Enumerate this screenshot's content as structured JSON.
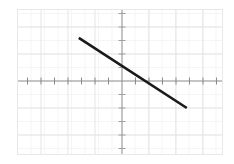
{
  "chart_data": {
    "type": "line",
    "title": "",
    "subtitle": "",
    "xlabel": "",
    "ylabel": "",
    "grid": true,
    "legend": null,
    "legend_position": "none",
    "xlim": [
      -7.7,
      7.4
    ],
    "ylim": [
      -6.1,
      5.3
    ],
    "x_tick_step": 1,
    "y_tick_step": 1,
    "x_tick_labels": [],
    "y_tick_labels": [],
    "series": [
      {
        "name": "line",
        "color": "#1a1a1a",
        "x": [
          -3.2,
          4.8
        ],
        "y": [
          3.2,
          -2.0
        ],
        "slope": -0.65,
        "y_intercept": 1.12,
        "x_intercept": 1.72,
        "endpoints": [
          {
            "x": -3.2,
            "y": 3.2
          },
          {
            "x": 4.8,
            "y": -2.0
          }
        ]
      }
    ],
    "annotations": []
  },
  "axes": {
    "x_axis_label": "x-axis",
    "y_axis_label": "y-axis",
    "origin_label": "origin"
  },
  "colors": {
    "line": "#1a1a1a",
    "axis": "#8a8a8a",
    "grid_major": "#e2e2e2",
    "grid_minor": "#f0f0f0",
    "frame": "#e8e8e8",
    "background": "#ffffff"
  }
}
